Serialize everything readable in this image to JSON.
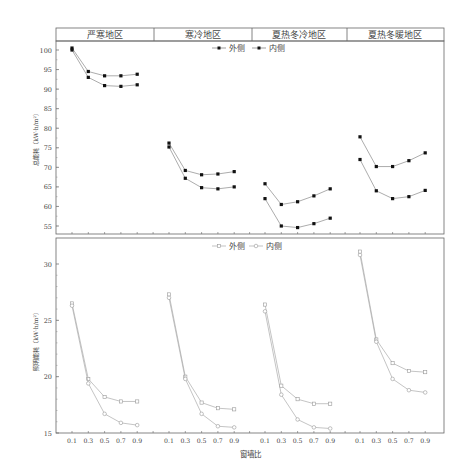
{
  "chart_data": [
    {
      "type": "line",
      "title": "",
      "panels": [
        "严寒地区",
        "寒冷地区",
        "夏热冬冷地区",
        "夏热冬暖地区"
      ],
      "categories": [
        "0.1",
        "0.3",
        "0.5",
        "0.7",
        "0.9"
      ],
      "ylabel": "总能耗（kW·h/m²）",
      "xlabel": "",
      "ylim": [
        53,
        103
      ],
      "yticks": [
        55,
        60,
        65,
        70,
        75,
        80,
        85,
        90,
        95,
        100
      ],
      "legend": [
        "外侧",
        "内侧"
      ],
      "legend_position": "top-center",
      "marker": "filled-square",
      "series": [
        {
          "name": "外侧",
          "panel": "严寒地区",
          "values": [
            100.5,
            94.5,
            93.4,
            93.4,
            93.8
          ]
        },
        {
          "name": "内侧",
          "panel": "严寒地区",
          "values": [
            100.0,
            93.0,
            90.9,
            90.7,
            91.1
          ]
        },
        {
          "name": "外侧",
          "panel": "寒冷地区",
          "values": [
            76.2,
            69.2,
            68.1,
            68.3,
            68.9
          ]
        },
        {
          "name": "内侧",
          "panel": "寒冷地区",
          "values": [
            75.2,
            67.2,
            64.8,
            64.5,
            65.0
          ]
        },
        {
          "name": "外侧",
          "panel": "夏热冬冷地区",
          "values": [
            65.8,
            60.5,
            61.2,
            62.7,
            64.5
          ]
        },
        {
          "name": "内侧",
          "panel": "夏热冬冷地区",
          "values": [
            62.0,
            55.0,
            54.6,
            55.6,
            57.0
          ]
        },
        {
          "name": "外侧",
          "panel": "夏热冬暖地区",
          "values": [
            77.8,
            70.2,
            70.2,
            71.7,
            73.7
          ]
        },
        {
          "name": "内侧",
          "panel": "夏热冬暖地区",
          "values": [
            72.0,
            64.0,
            62.0,
            62.5,
            64.1
          ]
        }
      ]
    },
    {
      "type": "line",
      "title": "",
      "panels": [
        "严寒地区",
        "寒冷地区",
        "夏热冬冷地区",
        "夏热冬暖地区"
      ],
      "categories": [
        "0.1",
        "0.3",
        "0.5",
        "0.7",
        "0.9"
      ],
      "ylabel": "照明能耗（kW·h/m²）",
      "xlabel": "窗墙比",
      "ylim": [
        15,
        32.5
      ],
      "yticks": [
        15,
        20,
        25,
        30
      ],
      "legend": [
        "外侧",
        "内侧"
      ],
      "legend_position": "top-center",
      "marker": "open-square",
      "series": [
        {
          "name": "外侧",
          "panel": "严寒地区",
          "values": [
            26.5,
            19.8,
            18.2,
            17.8,
            17.8
          ]
        },
        {
          "name": "内侧",
          "panel": "严寒地区",
          "values": [
            26.3,
            19.4,
            16.7,
            15.9,
            15.7
          ]
        },
        {
          "name": "外侧",
          "panel": "寒冷地区",
          "values": [
            27.3,
            20.0,
            17.7,
            17.2,
            17.1
          ]
        },
        {
          "name": "内侧",
          "panel": "寒冷地区",
          "values": [
            27.0,
            19.8,
            16.7,
            15.6,
            15.5
          ]
        },
        {
          "name": "外侧",
          "panel": "夏热冬冷地区",
          "values": [
            26.4,
            19.2,
            18.0,
            17.6,
            17.6
          ]
        },
        {
          "name": "内侧",
          "panel": "夏热冬冷地区",
          "values": [
            25.8,
            18.4,
            16.2,
            15.5,
            15.4
          ]
        },
        {
          "name": "外侧",
          "panel": "夏热冬暖地区",
          "values": [
            31.1,
            23.3,
            21.2,
            20.5,
            20.4
          ]
        },
        {
          "name": "内侧",
          "panel": "夏热冬暖地区",
          "values": [
            30.8,
            23.1,
            19.8,
            18.8,
            18.6
          ]
        }
      ]
    }
  ],
  "header": {
    "panels": [
      "严寒地区",
      "寒冷地区",
      "夏热冬冷地区",
      "夏热冬暖地区"
    ]
  },
  "top_chart": {
    "ylabel": "总能耗（kW·h/m²）",
    "legend_outer": "外侧",
    "legend_inner": "内侧"
  },
  "bottom_chart": {
    "ylabel": "照明能耗（kW·h/m²）",
    "legend_outer": "外侧",
    "legend_inner": "内侧",
    "xlabel": "窗墙比"
  }
}
